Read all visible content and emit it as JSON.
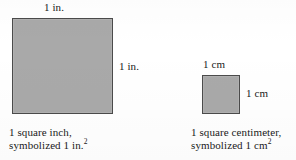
{
  "figure": {
    "background_color": "#ffffff",
    "fill_color": "#a9a9a9",
    "border_color": "#4b4b4b"
  },
  "square_inch": {
    "top_label": "1 in.",
    "right_label": "1 in.",
    "caption_line1": "1 square inch,",
    "caption_line2_prefix": "symbolized 1 in.",
    "caption_line2_exponent": "2"
  },
  "square_centimeter": {
    "top_label": "1 cm",
    "right_label": "1 cm",
    "caption_line1": "1 square centimeter,",
    "caption_line2_prefix": "symbolized 1 cm",
    "caption_line2_exponent": "2"
  }
}
